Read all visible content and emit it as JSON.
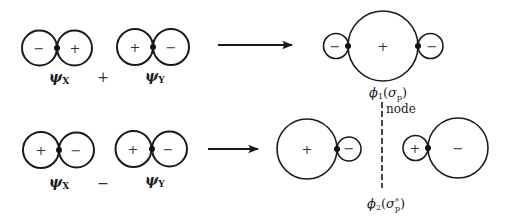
{
  "diagram": {
    "type": "molecular-orbital-combination",
    "rows": [
      {
        "operator": "+",
        "input_1": {
          "label": "ψ",
          "subscript": "X",
          "left_sign": "−",
          "right_sign": "+"
        },
        "input_2": {
          "label": "ψ",
          "subscript": "Y",
          "left_sign": "+",
          "right_sign": "−"
        },
        "result": {
          "label": "ϕ",
          "subscript": "1",
          "orbital": "σ",
          "orbital_sub": "p",
          "orbital_sup": "",
          "lobes": {
            "outer_left": "−",
            "center": "+",
            "outer_right": "−"
          }
        }
      },
      {
        "operator": "−",
        "input_1": {
          "label": "ψ",
          "subscript": "X",
          "left_sign": "+",
          "right_sign": "−"
        },
        "input_2": {
          "label": "ψ",
          "subscript": "Y",
          "left_sign": "+",
          "right_sign": "−"
        },
        "result": {
          "label": "ϕ",
          "subscript": "2",
          "orbital": "σ",
          "orbital_sub": "p",
          "orbital_sup": "*",
          "lobes": {
            "left_big": "+",
            "left_small": "−",
            "right_small": "+",
            "right_big": "−"
          }
        }
      }
    ],
    "node_label": "node",
    "colors": {
      "ink": "#1a1a1a",
      "background": "#ffffff"
    }
  }
}
